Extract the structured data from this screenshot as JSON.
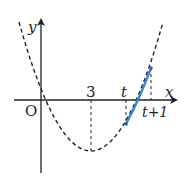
{
  "diagram": {
    "axes": {
      "x_label": "x",
      "y_label": "y",
      "origin_label": "O"
    },
    "labels": {
      "vertex_x": "3",
      "t": "t",
      "t_plus_1": "t+1"
    },
    "curve": {
      "type": "parabola",
      "style": "dashed",
      "vertex_x": 3,
      "roots": [
        0,
        6
      ]
    },
    "highlight": {
      "from": "t",
      "to": "t+1",
      "color": "#3a86d0"
    },
    "colors": {
      "curve": "#222222",
      "highlight": "#3a86d0"
    }
  }
}
